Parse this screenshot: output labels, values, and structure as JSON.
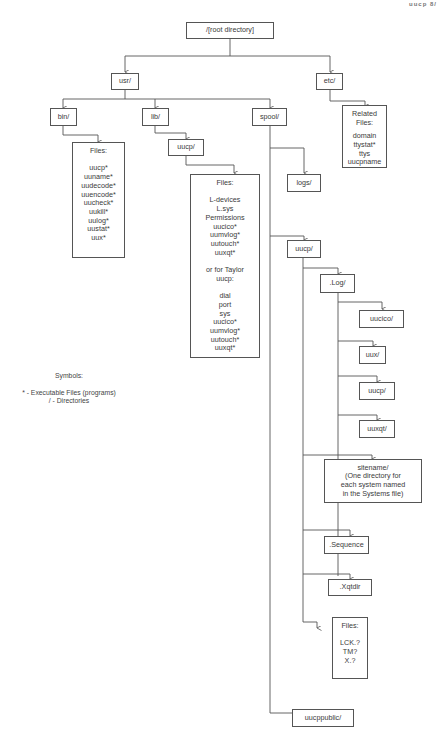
{
  "corner_header": "uucp  8/",
  "nodes": {
    "root": {
      "label": "/[root directory]"
    },
    "usr": {
      "label": "usr/"
    },
    "etc": {
      "label": "etc/"
    },
    "bin": {
      "label": "bin/"
    },
    "lib": {
      "label": "lib/"
    },
    "spool": {
      "label": "spool/"
    },
    "etc_files": {
      "lines": [
        "Related",
        "Files:",
        "",
        "domain",
        "ttystat*",
        "ttys",
        "uucpname"
      ]
    },
    "bin_files": {
      "lines": [
        "Files:",
        "",
        "uucp*",
        "uuname*",
        "uudecode*",
        "uuencode*",
        "uucheck*",
        "uukill*",
        "uulog*",
        "uustat*",
        "uux*"
      ]
    },
    "lib_uucp": {
      "label": "uucp/"
    },
    "lib_uucp_files": {
      "lines": [
        "Files:",
        "",
        "L-devices",
        "L.sys",
        "Permissions",
        "uucico*",
        "uumvlog*",
        "uutouch*",
        "uuxqt*",
        "",
        "or for Taylor",
        "uucp:",
        "",
        "dial",
        "port",
        "sys",
        "uucico*",
        "uumvlog*",
        "uutouch*",
        "uuxqt*"
      ]
    },
    "logs": {
      "label": "logs/"
    },
    "spool_uucp": {
      "label": "uucp/"
    },
    "log": {
      "label": ".Log/"
    },
    "log_uucico": {
      "label": "uucico/"
    },
    "log_uux": {
      "label": "uux/"
    },
    "log_uucp": {
      "label": "uucp/"
    },
    "log_uuxqt": {
      "label": "uuxqt/"
    },
    "sitename": {
      "lines": [
        "sitename/",
        "(One directory for",
        "each system named",
        "in the Systems file)"
      ]
    },
    "sequence": {
      "label": ".Sequence"
    },
    "xqtdir": {
      "label": ".Xqtdir"
    },
    "spool_files": {
      "lines": [
        "Files:",
        "",
        "LCK.?",
        "TM?",
        "X.?"
      ]
    },
    "uucppublic": {
      "label": "uucppublic/"
    }
  },
  "legend": {
    "title": "Symbols:",
    "items": [
      "* - Executable Files (programs)",
      "/ - Directories"
    ]
  },
  "colors": {
    "line": "#555555",
    "text": "#3a3a3a",
    "background": "#ffffff"
  }
}
